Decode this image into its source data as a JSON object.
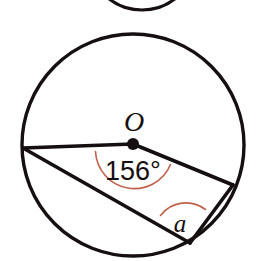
{
  "figure": {
    "background_color": "#ffffff",
    "line_color": "#15100f",
    "arc_color": "#c06049",
    "labels": {
      "center": "O",
      "central_angle": "156°",
      "inscribed_angle": "a"
    },
    "circle": {
      "center_x": 133,
      "center_y": 145,
      "radius": 111
    },
    "points": {
      "center_dot_x": 133,
      "center_dot_y": 144,
      "left_x": 23,
      "left_y": 148,
      "right_x": 233,
      "right_y": 185,
      "bottom_x": 190,
      "bottom_y": 243
    },
    "partial_circle_top": {
      "center_x": 142,
      "center_y": -44,
      "radius": 54
    }
  }
}
